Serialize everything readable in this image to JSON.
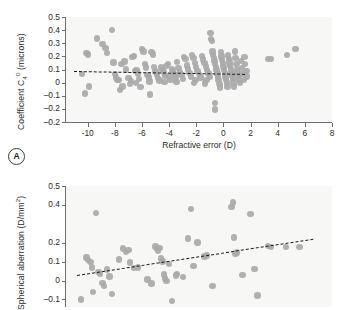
{
  "figure": {
    "panel_a_tag": "A",
    "marker_color": "#a9a9a9",
    "trend_color": "#1d1d1d",
    "plot_background": "#f7f7f5",
    "axis_color": "#6f6f6f"
  },
  "chart_data": [
    {
      "type": "scatter",
      "panel": "A",
      "title": "",
      "xlabel": "Refractive error (D)",
      "ylabel": "Coefficient C₄⁰ (microns)",
      "ylabel_parts": {
        "prefix": "Coefficient C",
        "sub": "4",
        "sup": "0",
        "suffix": " (microns)"
      },
      "xlim": [
        -11.6,
        8.0
      ],
      "ylim": [
        -0.3,
        0.5
      ],
      "xticks": [
        -10,
        -8,
        -6,
        -4,
        -2,
        0,
        2,
        4,
        6,
        8
      ],
      "xticklabels": [
        "-10",
        "-8",
        "-6",
        "-4",
        "-2",
        "0",
        "2",
        "4",
        "6",
        "8"
      ],
      "yticks": [
        0.5,
        0.4,
        0.3,
        0.2,
        0.1,
        0.0,
        -0.1,
        -0.2,
        -0.3
      ],
      "yticklabels": [
        "0.5",
        "0.4",
        "0.3",
        "0.2",
        "0.1",
        "0",
        "–0.1",
        "–0.2",
        "–0.2"
      ],
      "grid": false,
      "legend": "none",
      "trendline": {
        "x0": -11.0,
        "y0": 0.086,
        "x1": 1.6,
        "y1": 0.064,
        "style": "dashed"
      },
      "points": [
        [
          -10.4,
          0.065
        ],
        [
          -10.1,
          0.225
        ],
        [
          -10.0,
          0.215
        ],
        [
          -9.9,
          -0.028
        ],
        [
          -10.2,
          -0.082
        ],
        [
          -9.3,
          0.337
        ],
        [
          -8.9,
          0.296
        ],
        [
          -8.7,
          0.262
        ],
        [
          -8.6,
          0.228
        ],
        [
          -8.2,
          0.402
        ],
        [
          -8.1,
          0.152
        ],
        [
          -8.0,
          0.066
        ],
        [
          -7.9,
          0.04
        ],
        [
          -7.8,
          0.02
        ],
        [
          -7.7,
          0.018
        ],
        [
          -7.6,
          -0.055
        ],
        [
          -7.5,
          0.14
        ],
        [
          -7.3,
          0.16
        ],
        [
          -7.2,
          0.1
        ],
        [
          -7.0,
          0.036
        ],
        [
          -6.9,
          -0.012
        ],
        [
          -6.8,
          0.012
        ],
        [
          -6.7,
          0.195
        ],
        [
          -6.6,
          0.205
        ],
        [
          -6.5,
          0.088
        ],
        [
          -6.4,
          0.096
        ],
        [
          -6.3,
          0.07
        ],
        [
          -6.2,
          0.03
        ],
        [
          -6.1,
          -0.032
        ],
        [
          -6.0,
          0.255
        ],
        [
          -5.9,
          0.238
        ],
        [
          -5.8,
          0.14
        ],
        [
          -5.7,
          0.114
        ],
        [
          -5.6,
          0.06
        ],
        [
          -5.5,
          0.04
        ],
        [
          -5.4,
          -0.09
        ],
        [
          -5.3,
          0.232
        ],
        [
          -5.2,
          0.214
        ],
        [
          -5.1,
          0.12
        ],
        [
          -5.0,
          0.086
        ],
        [
          -4.9,
          0.06
        ],
        [
          -4.8,
          0.034
        ],
        [
          -4.7,
          0.016
        ],
        [
          -4.6,
          0.118
        ],
        [
          -4.5,
          0.098
        ],
        [
          -4.4,
          0.078
        ],
        [
          -4.3,
          0.052
        ],
        [
          -4.2,
          0.128
        ],
        [
          -4.1,
          0.142
        ],
        [
          -4.0,
          0.046
        ],
        [
          -3.9,
          0.02
        ],
        [
          -3.8,
          0.1
        ],
        [
          -3.7,
          0.084
        ],
        [
          -3.6,
          0.062
        ],
        [
          -3.5,
          0.04
        ],
        [
          -3.4,
          0.158
        ],
        [
          -3.3,
          0.11
        ],
        [
          -3.2,
          0.08
        ],
        [
          -3.1,
          0.056
        ],
        [
          -3.0,
          0.03
        ],
        [
          -2.9,
          0.196
        ],
        [
          -2.8,
          0.178
        ],
        [
          -2.7,
          0.132
        ],
        [
          -2.6,
          0.1
        ],
        [
          -2.5,
          0.072
        ],
        [
          -2.4,
          0.046
        ],
        [
          -2.3,
          0.21
        ],
        [
          -2.2,
          0.188
        ],
        [
          -2.1,
          0.15
        ],
        [
          -2.0,
          0.118
        ],
        [
          -1.9,
          0.09
        ],
        [
          -1.8,
          0.064
        ],
        [
          -1.7,
          0.038
        ],
        [
          -1.6,
          0.205
        ],
        [
          -1.5,
          0.176
        ],
        [
          -1.4,
          0.148
        ],
        [
          -1.3,
          0.122
        ],
        [
          -1.2,
          0.096
        ],
        [
          -1.1,
          0.07
        ],
        [
          -1.0,
          0.044
        ],
        [
          -0.95,
          0.378
        ],
        [
          -0.9,
          0.334
        ],
        [
          -0.85,
          0.318
        ],
        [
          -0.8,
          0.236
        ],
        [
          -0.75,
          0.214
        ],
        [
          -0.7,
          0.19
        ],
        [
          -0.65,
          0.166
        ],
        [
          -0.6,
          0.142
        ],
        [
          -0.55,
          0.118
        ],
        [
          -0.5,
          0.094
        ],
        [
          -0.45,
          0.07
        ],
        [
          -0.4,
          0.046
        ],
        [
          -0.35,
          0.022
        ],
        [
          -0.3,
          -0.01
        ],
        [
          -0.6,
          -0.155
        ],
        [
          -0.62,
          -0.205
        ],
        [
          -0.2,
          0.232
        ],
        [
          -0.15,
          0.2
        ],
        [
          -0.1,
          0.172
        ],
        [
          -0.05,
          0.146
        ],
        [
          0.0,
          0.12
        ],
        [
          0.05,
          0.096
        ],
        [
          0.1,
          0.072
        ],
        [
          0.15,
          0.048
        ],
        [
          0.2,
          0.024
        ],
        [
          0.25,
          0.0
        ],
        [
          0.3,
          -0.03
        ],
        [
          0.35,
          0.208
        ],
        [
          0.4,
          0.18
        ],
        [
          0.45,
          0.152
        ],
        [
          0.5,
          0.126
        ],
        [
          0.55,
          0.1
        ],
        [
          0.6,
          0.074
        ],
        [
          0.65,
          0.05
        ],
        [
          0.7,
          0.026
        ],
        [
          0.75,
          0.002
        ],
        [
          0.8,
          -0.028
        ],
        [
          0.85,
          0.236
        ],
        [
          0.9,
          0.188
        ],
        [
          0.95,
          0.14
        ],
        [
          1.0,
          0.104
        ],
        [
          1.05,
          0.078
        ],
        [
          1.1,
          0.052
        ],
        [
          1.15,
          0.024
        ],
        [
          1.2,
          -0.004
        ],
        [
          1.3,
          0.164
        ],
        [
          1.35,
          0.11
        ],
        [
          1.4,
          0.066
        ],
        [
          1.5,
          0.02
        ],
        [
          1.55,
          0.196
        ],
        [
          1.6,
          0.142
        ],
        [
          1.7,
          0.088
        ],
        [
          1.75,
          0.046
        ],
        [
          -2.05,
          0.022
        ],
        [
          -2.15,
          -0.004
        ],
        [
          -1.25,
          0.018
        ],
        [
          -1.35,
          -0.008
        ],
        [
          -0.25,
          -0.038
        ],
        [
          -3.45,
          0.006
        ],
        [
          -4.35,
          0.004
        ],
        [
          -5.45,
          0.01
        ],
        [
          -6.45,
          -0.002
        ],
        [
          -7.45,
          -0.028
        ],
        [
          3.3,
          0.178
        ],
        [
          3.5,
          0.18
        ],
        [
          4.7,
          0.212
        ],
        [
          5.3,
          0.258
        ]
      ]
    },
    {
      "type": "scatter",
      "panel": "B",
      "title": "",
      "xlabel": "",
      "ylabel": "Spherical aberration (D/mm²)",
      "ylabel_parts": {
        "prefix": "Spherical aberration (D/mm",
        "sup": "2",
        "suffix": ")"
      },
      "xlim": [
        -11.6,
        8.0
      ],
      "ylim": [
        -0.14,
        0.5
      ],
      "xticks": [],
      "xticklabels": [],
      "yticks": [
        0.5,
        0.4,
        0.2,
        0.1,
        0.0,
        -0.1
      ],
      "yticklabels": [
        "0.5",
        "0.4",
        "0.2",
        "0.1",
        "0",
        "–0.1"
      ],
      "grid": false,
      "legend": "none",
      "trendline": {
        "x0": -10.8,
        "y0": 0.03,
        "x1": 6.6,
        "y1": 0.222,
        "style": "dashed"
      },
      "points": [
        [
          -10.5,
          -0.1
        ],
        [
          -10.1,
          0.122
        ],
        [
          -10.0,
          0.108
        ],
        [
          -9.8,
          0.098
        ],
        [
          -9.7,
          0.07
        ],
        [
          -9.6,
          -0.06
        ],
        [
          -9.4,
          0.358
        ],
        [
          -9.2,
          0.046
        ],
        [
          -9.1,
          0.034
        ],
        [
          -8.9,
          -0.012
        ],
        [
          -8.8,
          -0.03
        ],
        [
          -8.6,
          0.058
        ],
        [
          -8.4,
          0.022
        ],
        [
          -8.2,
          -0.07
        ],
        [
          -7.7,
          0.112
        ],
        [
          -7.4,
          0.17
        ],
        [
          -7.2,
          0.152
        ],
        [
          -7.0,
          0.162
        ],
        [
          -6.6,
          0.066
        ],
        [
          -6.3,
          0.07
        ],
        [
          -5.6,
          0.006
        ],
        [
          -5.3,
          -0.016
        ],
        [
          -5.0,
          0.18
        ],
        [
          -4.9,
          0.168
        ],
        [
          -4.8,
          0.158
        ],
        [
          -4.7,
          0.172
        ],
        [
          -4.6,
          0.116
        ],
        [
          -4.5,
          0.1
        ],
        [
          -4.4,
          0.032
        ],
        [
          -4.3,
          0.01
        ],
        [
          -4.2,
          -0.004
        ],
        [
          -4.0,
          0.088
        ],
        [
          -3.8,
          -0.108
        ],
        [
          -3.5,
          0.026
        ],
        [
          -3.4,
          0.034
        ],
        [
          -2.6,
          0.222
        ],
        [
          -2.4,
          0.38
        ],
        [
          -2.2,
          0.078
        ],
        [
          -1.9,
          0.202
        ],
        [
          -1.4,
          0.128
        ],
        [
          -1.2,
          0.132
        ],
        [
          -0.8,
          -0.028
        ],
        [
          0.6,
          0.388
        ],
        [
          0.7,
          0.412
        ],
        [
          0.8,
          0.228
        ],
        [
          0.9,
          0.142
        ],
        [
          1.0,
          0.148
        ],
        [
          1.4,
          0.03
        ],
        [
          2.0,
          0.352
        ],
        [
          2.3,
          0.06
        ],
        [
          2.5,
          -0.08
        ],
        [
          3.3,
          0.182
        ],
        [
          3.5,
          0.178
        ],
        [
          4.6,
          0.178
        ],
        [
          5.6,
          0.178
        ],
        [
          -6.9,
          0.096
        ],
        [
          -3.0,
          0.018
        ]
      ]
    }
  ]
}
